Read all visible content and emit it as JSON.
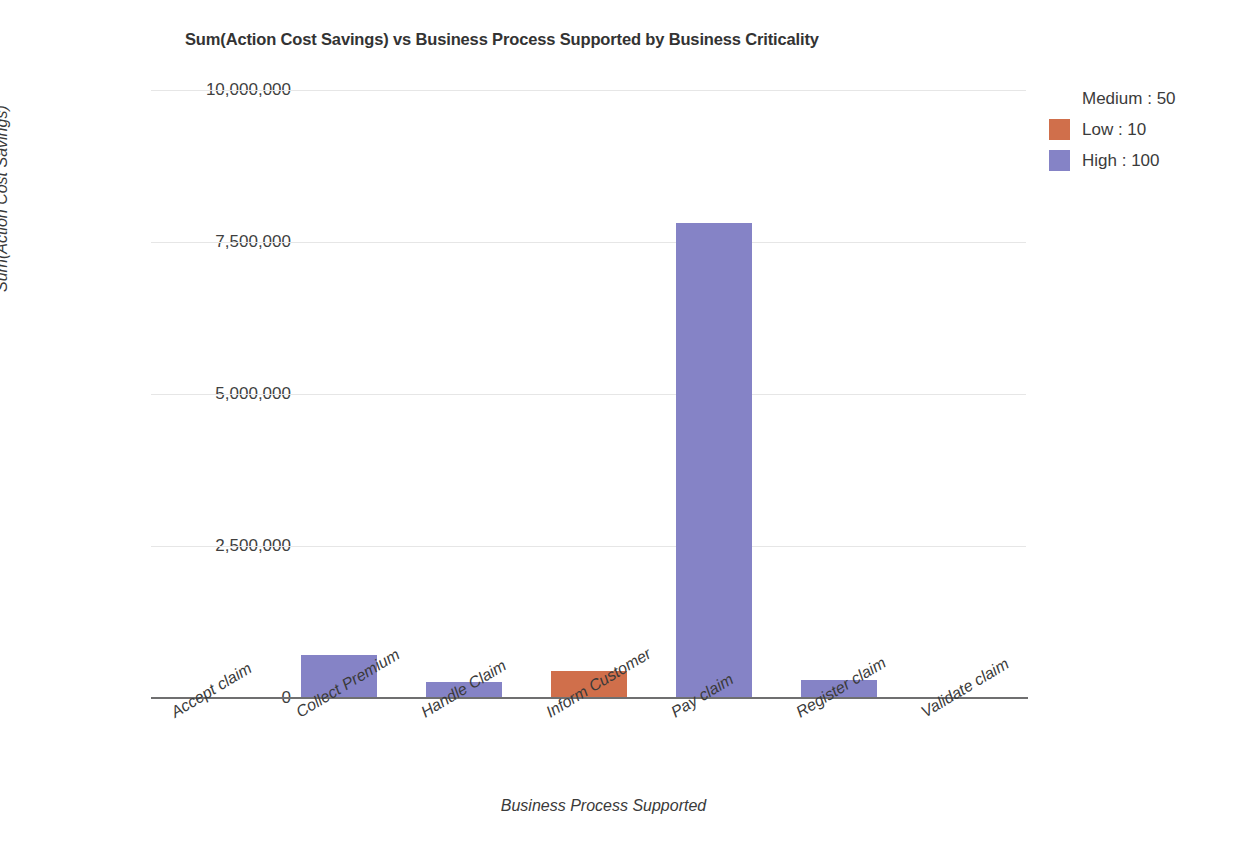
{
  "chart_data": {
    "type": "bar",
    "subtype": "stacked",
    "title": "Sum(Action Cost Savings) vs Business Process Supported by Business Criticality",
    "xlabel": "Business Process Supported",
    "ylabel": "Sum(Action Cost Savings)",
    "ylim": [
      0,
      10000000
    ],
    "ytick_values": [
      10000000,
      7500000,
      5000000,
      2500000,
      0
    ],
    "ytick_labels": [
      "10,000,000",
      "7,500,000",
      "5,000,000",
      "2,500,000",
      "0"
    ],
    "grid": true,
    "legend_position": "right",
    "categories": [
      "Accept claim",
      "Collect Premium",
      "Handle Claim",
      "Inform Customer",
      "Pay claim",
      "Register claim",
      "Validate claim"
    ],
    "series": [
      {
        "name": "High : 100",
        "color": "#8583c6",
        "values": [
          0,
          700000,
          260000,
          0,
          7810000,
          300000,
          0
        ]
      },
      {
        "name": "Low : 10",
        "color": "#d06f4b",
        "values": [
          0,
          0,
          0,
          450000,
          0,
          0,
          0
        ]
      },
      {
        "name": "Medium : 50",
        "color": "#f7b councilman",
        "values": [
          1470000,
          1550000,
          1590000,
          0,
          1570000,
          0,
          1470000
        ]
      }
    ],
    "totals": [
      1470000,
      2250000,
      1850000,
      450000,
      9380000,
      300000,
      1470000
    ]
  },
  "legend": {
    "items": [
      {
        "label": "Medium : 50",
        "color": "#f9b martie"
      },
      {
        "label": "Low : 10",
        "color": "#d06f4b"
      },
      {
        "label": "High : 100",
        "color": "#8583c6"
      }
    ]
  },
  "colors": {
    "medium": "#f9b348",
    "low": "#d06f4b",
    "high": "#8583c6",
    "gridline": "#e6e6e6",
    "axis": "#6f6f70",
    "text": "#3b3b3b"
  }
}
